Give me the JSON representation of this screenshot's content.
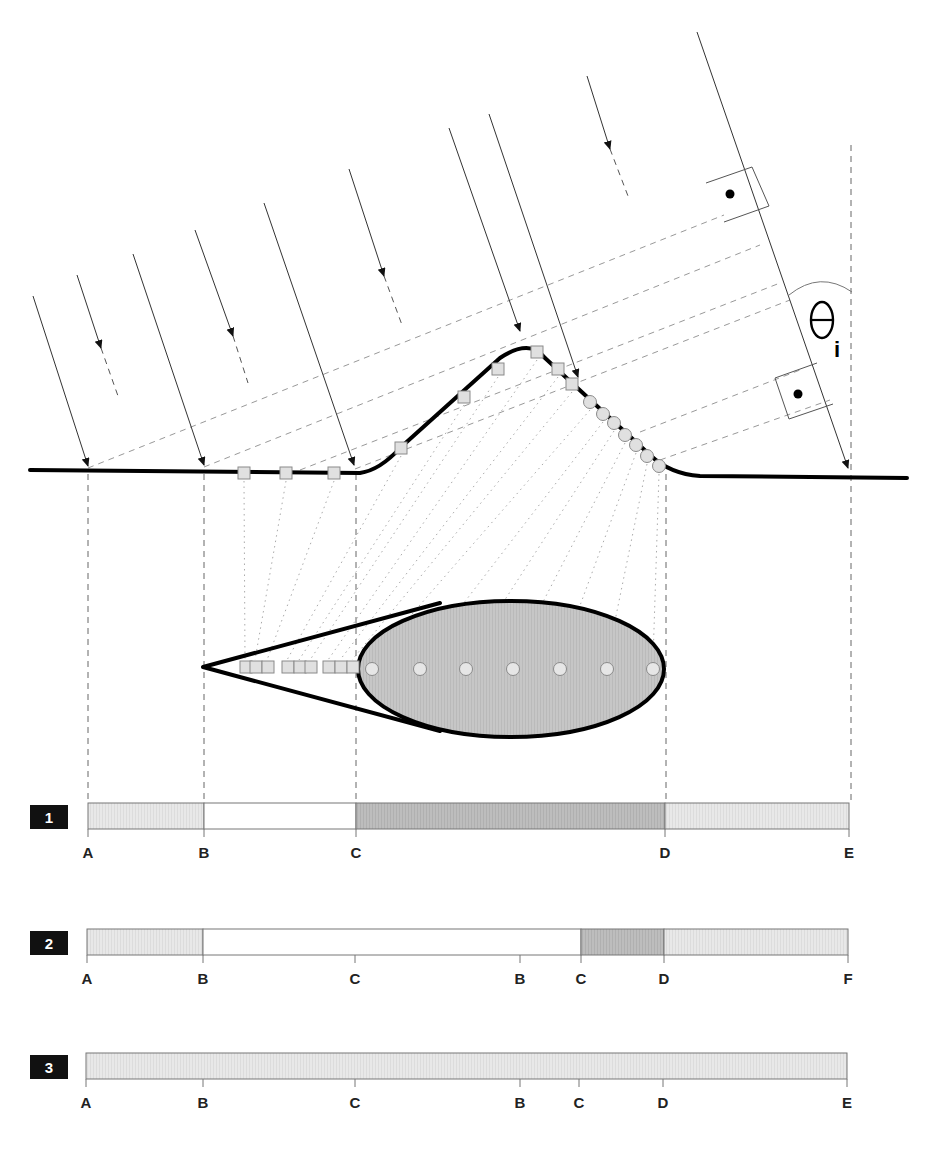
{
  "colors": {
    "light_fill": "#e6e6e6",
    "dark_fill": "#bcbcbc",
    "ellipse_fill": "#c4c4c4",
    "marker_fill": "#e0e0e0",
    "marker_stroke": "#8a8a8a",
    "ray": "#333333",
    "dash": "#999999",
    "terrain": "#000000",
    "badge": "#111111"
  },
  "angle_label": {
    "symbol": "θ",
    "subscript": "i"
  },
  "incident_rays": [
    {
      "x1": 33,
      "y1": 296,
      "x2": 88,
      "y2": 466
    },
    {
      "x1": 133,
      "y1": 254,
      "x2": 204,
      "y2": 465
    },
    {
      "x1": 264,
      "y1": 203,
      "x2": 354,
      "y2": 465
    },
    {
      "x1": 449,
      "y1": 128,
      "x2": 520,
      "y2": 331
    },
    {
      "x1": 489,
      "y1": 114,
      "x2": 578,
      "y2": 377
    },
    {
      "x1": 697,
      "y1": 32,
      "x2": 848,
      "y2": 468
    }
  ],
  "short_rays": [
    {
      "x1": 77,
      "y1": 275,
      "x2": 101,
      "y2": 348,
      "dx2": 118,
      "dy2": 396
    },
    {
      "x1": 195,
      "y1": 230,
      "x2": 233,
      "y2": 336,
      "dx2": 248,
      "dy2": 383
    },
    {
      "x1": 349,
      "y1": 169,
      "x2": 384,
      "y2": 276,
      "dx2": 402,
      "dy2": 325
    },
    {
      "x1": 587,
      "y1": 76,
      "x2": 610,
      "y2": 149,
      "dx2": 628,
      "dy2": 196
    }
  ],
  "wavefronts": [
    {
      "x1": 88,
      "y1": 468,
      "x2": 724,
      "y2": 215
    },
    {
      "x1": 204,
      "y1": 467,
      "x2": 760,
      "y2": 245
    },
    {
      "x1": 300,
      "y1": 470,
      "x2": 780,
      "y2": 283
    },
    {
      "x1": 355,
      "y1": 469,
      "x2": 790,
      "y2": 300
    },
    {
      "x1": 640,
      "y1": 432,
      "x2": 800,
      "y2": 370
    },
    {
      "x1": 660,
      "y1": 460,
      "x2": 830,
      "y2": 400
    }
  ],
  "squares": [
    {
      "x": 244,
      "y": 473
    },
    {
      "x": 286,
      "y": 473
    },
    {
      "x": 334,
      "y": 473
    },
    {
      "x": 401,
      "y": 448
    },
    {
      "x": 464,
      "y": 397
    },
    {
      "x": 498,
      "y": 369
    },
    {
      "x": 537,
      "y": 352
    },
    {
      "x": 558,
      "y": 369
    },
    {
      "x": 572,
      "y": 384
    }
  ],
  "circles": [
    {
      "x": 590,
      "y": 402
    },
    {
      "x": 603,
      "y": 414
    },
    {
      "x": 614,
      "y": 423
    },
    {
      "x": 625,
      "y": 435
    },
    {
      "x": 636,
      "y": 445
    },
    {
      "x": 647,
      "y": 456
    },
    {
      "x": 659,
      "y": 466
    }
  ],
  "projection_lines": [
    {
      "x1": 88,
      "y1": 474,
      "x2": 88,
      "y2": 800
    },
    {
      "x1": 204,
      "y1": 474,
      "x2": 204,
      "y2": 800
    },
    {
      "x1": 356,
      "y1": 474,
      "x2": 356,
      "y2": 800
    },
    {
      "x1": 666,
      "y1": 474,
      "x2": 666,
      "y2": 800
    },
    {
      "x1": 851,
      "y1": 145,
      "x2": 851,
      "y2": 800
    }
  ],
  "image_squares": [
    {
      "x": 240
    },
    {
      "x": 250
    },
    {
      "x": 262
    },
    {
      "x": 282
    },
    {
      "x": 294
    },
    {
      "x": 305
    },
    {
      "x": 323
    },
    {
      "x": 335
    },
    {
      "x": 347
    }
  ],
  "image_circles": [
    {
      "x": 372
    },
    {
      "x": 420
    },
    {
      "x": 466
    },
    {
      "x": 513
    },
    {
      "x": 560
    },
    {
      "x": 607
    },
    {
      "x": 653
    }
  ],
  "strips": [
    {
      "id": "1",
      "y": 803,
      "segments": [
        {
          "x1": 88,
          "x2": 204,
          "fill": "light"
        },
        {
          "x1": 204,
          "x2": 356,
          "fill": "white"
        },
        {
          "x1": 356,
          "x2": 665,
          "fill": "dark"
        },
        {
          "x1": 665,
          "x2": 849,
          "fill": "light"
        }
      ],
      "ticks": [
        {
          "x": 88,
          "label": "A"
        },
        {
          "x": 204,
          "label": "B"
        },
        {
          "x": 356,
          "label": "C"
        },
        {
          "x": 665,
          "label": "D"
        },
        {
          "x": 849,
          "label": "E"
        }
      ]
    },
    {
      "id": "2",
      "y": 929,
      "segments": [
        {
          "x1": 87,
          "x2": 203,
          "fill": "light"
        },
        {
          "x1": 203,
          "x2": 581,
          "fill": "white"
        },
        {
          "x1": 581,
          "x2": 664,
          "fill": "dark"
        },
        {
          "x1": 664,
          "x2": 848,
          "fill": "light"
        }
      ],
      "ticks": [
        {
          "x": 87,
          "label": "A"
        },
        {
          "x": 203,
          "label": "B"
        },
        {
          "x": 355,
          "label": "C"
        },
        {
          "x": 520,
          "label": "B"
        },
        {
          "x": 581,
          "label": "C"
        },
        {
          "x": 664,
          "label": "D"
        },
        {
          "x": 848,
          "label": "F"
        }
      ]
    },
    {
      "id": "3",
      "y": 1053,
      "segments": [
        {
          "x1": 86,
          "x2": 847,
          "fill": "light"
        }
      ],
      "ticks": [
        {
          "x": 86,
          "label": "A"
        },
        {
          "x": 203,
          "label": "B"
        },
        {
          "x": 355,
          "label": "C"
        },
        {
          "x": 520,
          "label": "B"
        },
        {
          "x": 579,
          "label": "C"
        },
        {
          "x": 663,
          "label": "D"
        },
        {
          "x": 847,
          "label": "E"
        }
      ]
    }
  ]
}
